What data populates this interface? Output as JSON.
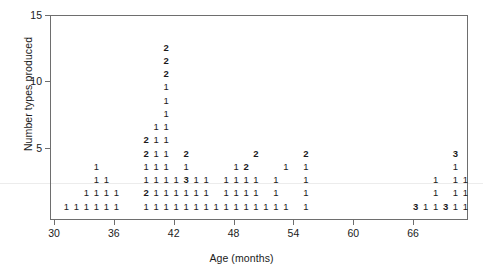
{
  "chart_data": {
    "type": "scatter",
    "title": "",
    "subtitle": "",
    "xlabel": "Age (months)",
    "ylabel": "Number types produced",
    "xlim": [
      30,
      71
    ],
    "ylim": [
      0,
      15
    ],
    "xticks": [
      30,
      36,
      42,
      48,
      54,
      60,
      66
    ],
    "yticks": [
      5,
      10,
      15
    ],
    "grid": false,
    "legend": null,
    "annotations": [],
    "point_label_meaning": "Each plotted character is the number of overlapping observations at that (age, number types produced) location.",
    "points": [
      {
        "x": 31,
        "y": 1,
        "label": "1"
      },
      {
        "x": 32,
        "y": 1,
        "label": "1"
      },
      {
        "x": 33,
        "y": 1,
        "label": "1"
      },
      {
        "x": 34,
        "y": 1,
        "label": "1"
      },
      {
        "x": 35,
        "y": 1,
        "label": "1"
      },
      {
        "x": 36,
        "y": 1,
        "label": "1"
      },
      {
        "x": 33,
        "y": 2,
        "label": "1"
      },
      {
        "x": 34,
        "y": 2,
        "label": "1"
      },
      {
        "x": 35,
        "y": 2,
        "label": "1"
      },
      {
        "x": 36,
        "y": 2,
        "label": "1"
      },
      {
        "x": 34,
        "y": 3,
        "label": "1"
      },
      {
        "x": 35,
        "y": 3,
        "label": "1"
      },
      {
        "x": 34,
        "y": 4,
        "label": "1"
      },
      {
        "x": 39,
        "y": 1,
        "label": "1"
      },
      {
        "x": 40,
        "y": 1,
        "label": "1"
      },
      {
        "x": 41,
        "y": 1,
        "label": "1"
      },
      {
        "x": 42,
        "y": 1,
        "label": "1"
      },
      {
        "x": 43,
        "y": 1,
        "label": "1"
      },
      {
        "x": 44,
        "y": 1,
        "label": "1"
      },
      {
        "x": 45,
        "y": 1,
        "label": "1"
      },
      {
        "x": 46,
        "y": 1,
        "label": "1"
      },
      {
        "x": 47,
        "y": 1,
        "label": "1"
      },
      {
        "x": 48,
        "y": 1,
        "label": "1"
      },
      {
        "x": 49,
        "y": 1,
        "label": "1"
      },
      {
        "x": 50,
        "y": 1,
        "label": "1"
      },
      {
        "x": 51,
        "y": 1,
        "label": "1"
      },
      {
        "x": 52,
        "y": 1,
        "label": "1"
      },
      {
        "x": 53,
        "y": 1,
        "label": "1"
      },
      {
        "x": 55,
        "y": 1,
        "label": "1"
      },
      {
        "x": 39,
        "y": 2,
        "label": "2"
      },
      {
        "x": 40,
        "y": 2,
        "label": "1"
      },
      {
        "x": 41,
        "y": 2,
        "label": "1"
      },
      {
        "x": 42,
        "y": 2,
        "label": "1"
      },
      {
        "x": 43,
        "y": 2,
        "label": "1"
      },
      {
        "x": 44,
        "y": 2,
        "label": "1"
      },
      {
        "x": 45,
        "y": 2,
        "label": "1"
      },
      {
        "x": 47,
        "y": 2,
        "label": "1"
      },
      {
        "x": 48,
        "y": 2,
        "label": "1"
      },
      {
        "x": 49,
        "y": 2,
        "label": "1"
      },
      {
        "x": 50,
        "y": 2,
        "label": "1"
      },
      {
        "x": 52,
        "y": 2,
        "label": "1"
      },
      {
        "x": 55,
        "y": 2,
        "label": "1"
      },
      {
        "x": 39,
        "y": 3,
        "label": "1"
      },
      {
        "x": 40,
        "y": 3,
        "label": "1"
      },
      {
        "x": 41,
        "y": 3,
        "label": "1"
      },
      {
        "x": 42,
        "y": 3,
        "label": "1"
      },
      {
        "x": 43,
        "y": 3,
        "label": "3"
      },
      {
        "x": 44,
        "y": 3,
        "label": "1"
      },
      {
        "x": 45,
        "y": 3,
        "label": "1"
      },
      {
        "x": 47,
        "y": 3,
        "label": "1"
      },
      {
        "x": 48,
        "y": 3,
        "label": "1"
      },
      {
        "x": 49,
        "y": 3,
        "label": "1"
      },
      {
        "x": 50,
        "y": 3,
        "label": "1"
      },
      {
        "x": 52,
        "y": 3,
        "label": "1"
      },
      {
        "x": 55,
        "y": 3,
        "label": "1"
      },
      {
        "x": 39,
        "y": 4,
        "label": "1"
      },
      {
        "x": 40,
        "y": 4,
        "label": "1"
      },
      {
        "x": 41,
        "y": 4,
        "label": "1"
      },
      {
        "x": 43,
        "y": 4,
        "label": "1"
      },
      {
        "x": 48,
        "y": 4,
        "label": "1"
      },
      {
        "x": 49,
        "y": 4,
        "label": "2"
      },
      {
        "x": 53,
        "y": 4,
        "label": "1"
      },
      {
        "x": 55,
        "y": 4,
        "label": "1"
      },
      {
        "x": 39,
        "y": 5,
        "label": "2"
      },
      {
        "x": 40,
        "y": 5,
        "label": "1"
      },
      {
        "x": 41,
        "y": 5,
        "label": "1"
      },
      {
        "x": 43,
        "y": 5,
        "label": "2"
      },
      {
        "x": 50,
        "y": 5,
        "label": "2"
      },
      {
        "x": 55,
        "y": 5,
        "label": "2"
      },
      {
        "x": 39,
        "y": 6,
        "label": "2"
      },
      {
        "x": 40,
        "y": 6,
        "label": "1"
      },
      {
        "x": 41,
        "y": 6,
        "label": "1"
      },
      {
        "x": 40,
        "y": 7,
        "label": "1"
      },
      {
        "x": 41,
        "y": 7,
        "label": "1"
      },
      {
        "x": 41,
        "y": 8,
        "label": "1"
      },
      {
        "x": 41,
        "y": 9,
        "label": "1"
      },
      {
        "x": 41,
        "y": 10,
        "label": "1"
      },
      {
        "x": 41,
        "y": 11,
        "label": "2"
      },
      {
        "x": 41,
        "y": 12,
        "label": "2"
      },
      {
        "x": 41,
        "y": 13,
        "label": "2"
      },
      {
        "x": 66,
        "y": 1,
        "label": "3"
      },
      {
        "x": 67,
        "y": 1,
        "label": "1"
      },
      {
        "x": 68,
        "y": 1,
        "label": "1"
      },
      {
        "x": 69,
        "y": 1,
        "label": "3"
      },
      {
        "x": 70,
        "y": 1,
        "label": "1"
      },
      {
        "x": 71,
        "y": 1,
        "label": "1"
      },
      {
        "x": 68,
        "y": 2,
        "label": "1"
      },
      {
        "x": 70,
        "y": 2,
        "label": "1"
      },
      {
        "x": 71,
        "y": 2,
        "label": "1"
      },
      {
        "x": 68,
        "y": 3,
        "label": "1"
      },
      {
        "x": 70,
        "y": 3,
        "label": "1"
      },
      {
        "x": 71,
        "y": 3,
        "label": "1"
      },
      {
        "x": 70,
        "y": 4,
        "label": "1"
      },
      {
        "x": 70,
        "y": 5,
        "label": "3"
      }
    ]
  },
  "axes": {
    "x_title": "Age (months)",
    "y_title": "Number types produced",
    "x_tick_labels": [
      "30",
      "36",
      "42",
      "48",
      "54",
      "60",
      "66"
    ],
    "y_tick_labels": [
      "5",
      "10",
      "15"
    ]
  },
  "colors": {
    "axis": "#6e6e6e",
    "text": "#1a1a1a",
    "background": "#ffffff"
  }
}
